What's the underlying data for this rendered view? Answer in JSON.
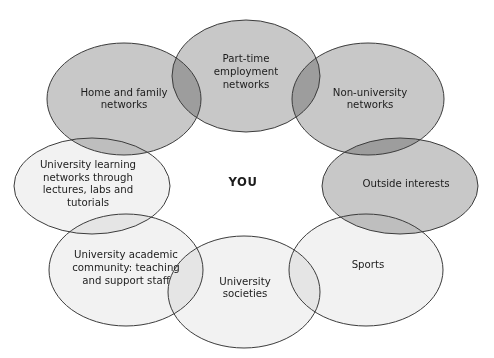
{
  "figure": {
    "type": "venn-ring-diagram",
    "center_label": "YOU",
    "background_color": "#ffffff",
    "stroke_color": "#3c3c3c",
    "dark_fill_color": "#c8c8c8",
    "light_fill_color": "#f2f2f2",
    "dark_overlap_color": "#9a9a9a",
    "light_overlap_color": "#e4e4e4"
  },
  "center": {
    "label": "YOU",
    "cx": 243,
    "cy": 182
  },
  "ellipses": [
    {
      "id": "home-and-family-networks",
      "label": "Home and family networks",
      "lines": [
        "Home and family",
        "networks"
      ],
      "cx": 124,
      "cy": 99,
      "rx": 77,
      "ry": 56,
      "fill": "#c8c8c8",
      "shade": "dark",
      "text_cx": 124,
      "text_cy": 99
    },
    {
      "id": "part-time-employment-networks",
      "label": "Part-time employment networks",
      "lines": [
        "Part-time",
        "employment",
        "networks"
      ],
      "cx": 246,
      "cy": 76,
      "rx": 74,
      "ry": 56,
      "fill": "#c8c8c8",
      "shade": "dark",
      "text_cx": 246,
      "text_cy": 72
    },
    {
      "id": "non-university-networks",
      "label": "Non-university networks",
      "lines": [
        "Non-university",
        "networks"
      ],
      "cx": 368,
      "cy": 99,
      "rx": 76,
      "ry": 56,
      "fill": "#c8c8c8",
      "shade": "dark",
      "text_cx": 370,
      "text_cy": 99
    },
    {
      "id": "outside-interests",
      "label": "Outside interests",
      "lines": [
        "Outside interests"
      ],
      "cx": 400,
      "cy": 186,
      "rx": 78,
      "ry": 48,
      "fill": "#c8c8c8",
      "shade": "dark",
      "text_cx": 406,
      "text_cy": 184
    },
    {
      "id": "sports",
      "label": "Sports",
      "lines": [
        "Sports"
      ],
      "cx": 366,
      "cy": 270,
      "rx": 77,
      "ry": 56,
      "fill": "#f2f2f2",
      "shade": "light",
      "text_cx": 368,
      "text_cy": 265
    },
    {
      "id": "university-societies",
      "label": "University societies",
      "lines": [
        "University",
        "societies"
      ],
      "cx": 244,
      "cy": 292,
      "rx": 76,
      "ry": 56,
      "fill": "#f2f2f2",
      "shade": "light",
      "text_cx": 245,
      "text_cy": 288
    },
    {
      "id": "university-academic-community",
      "label": "University academic community: teaching and support staff",
      "lines": [
        "University academic",
        "community: teaching",
        "and support staff"
      ],
      "cx": 126,
      "cy": 270,
      "rx": 77,
      "ry": 56,
      "fill": "#f2f2f2",
      "shade": "light",
      "text_cx": 126,
      "text_cy": 268
    },
    {
      "id": "university-learning-networks",
      "label": "University learning networks through lectures, labs and tutorials",
      "lines": [
        "University learning",
        "networks through",
        "lectures, labs and",
        "tutorials"
      ],
      "cx": 92,
      "cy": 186,
      "rx": 78,
      "ry": 48,
      "fill": "#f2f2f2",
      "shade": "light",
      "text_cx": 88,
      "text_cy": 184
    }
  ]
}
